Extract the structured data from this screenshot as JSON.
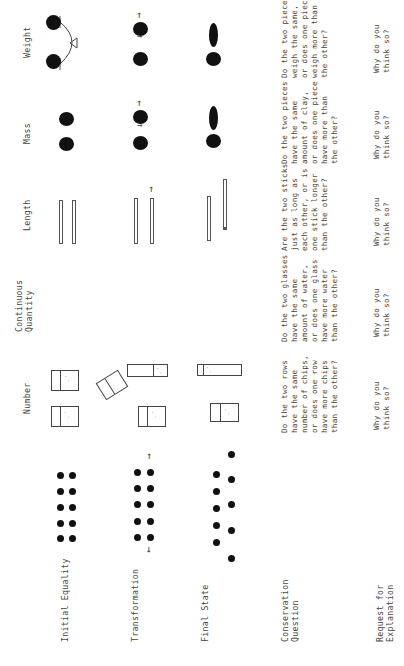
{
  "columns": [
    {
      "key": "number",
      "label": "Number"
    },
    {
      "key": "continuous_quantity",
      "label": "Continuous\nQuantity"
    },
    {
      "key": "length",
      "label": "Length"
    },
    {
      "key": "mass",
      "label": "Mass"
    },
    {
      "key": "weight",
      "label": "Weight"
    }
  ],
  "rows": [
    {
      "key": "initial_equality",
      "label": "Initial Equality"
    },
    {
      "key": "transformation",
      "label": "Transformation"
    },
    {
      "key": "final_state",
      "label": "Final State"
    },
    {
      "key": "conservation_question",
      "label": "Conservation\nQuestion"
    },
    {
      "key": "request_for_explanation",
      "label": "Request for\nExplanation"
    }
  ],
  "questions": {
    "number": "Do the two rows\nhave the same\nnumber of chips,\nor does one row\nhave more chips\nthan the other?",
    "continuous_quantity": "Do the two glasses\nhave the same\namount of water,\nor does one glass\nhave more water\nthan the other?",
    "length": "Are the two sticks\njust as long as\neach other, or is\none stick longer\nthan the other?",
    "mass": "Do the two pieces\nhave the same\namount of clay,\nor does one piece\nhave more than\nthe other?",
    "weight": "Do the two pieces\nweigh the same,\nor does one piece\nweigh more than\nthe other?"
  },
  "explanation": {
    "number": "Why do you\nthink so?",
    "continuous_quantity": "Why do you\nthink so?",
    "length": "Why do you\nthink so?",
    "mass": "Why do you\nthink so?",
    "weight": "Why do you\nthink so?"
  },
  "icons": {
    "arrow_up": "↑",
    "arrow_right": "→",
    "arrow_left": "←"
  },
  "colors": {
    "ink": "#111111",
    "text": "#444444",
    "background": "#ffffff"
  }
}
